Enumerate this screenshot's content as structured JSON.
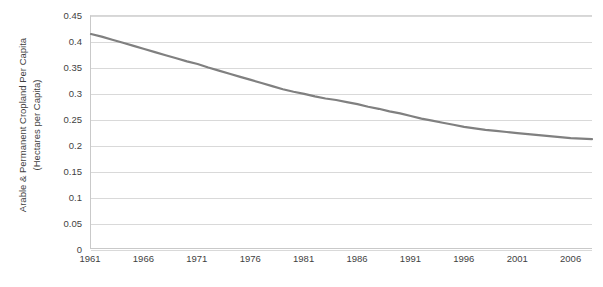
{
  "chart_data": {
    "type": "line",
    "title": "",
    "xlabel": "",
    "ylabel": "Arable & Permanent Cropland Per Capita (Hectares per Capita)",
    "ylabel_line1": "Arable & Permanent Cropland Per Capita",
    "ylabel_line2": "(Hectares per Capita)",
    "grid": true,
    "legend": "none",
    "series_color": "#808080",
    "grid_color": "#d9d9d9",
    "axis_color": "#c9c9c9",
    "xlim": [
      1961,
      2008
    ],
    "ylim": [
      0,
      0.45
    ],
    "ytick_labels": [
      "0.45",
      "0.4",
      "0.35",
      "0.3",
      "0.25",
      "0.2",
      "0.15",
      "0.1",
      "0.05",
      "0"
    ],
    "ytick_values": [
      0.45,
      0.4,
      0.35,
      0.3,
      0.25,
      0.2,
      0.15,
      0.1,
      0.05,
      0
    ],
    "xtick_labels": [
      "1961",
      "1966",
      "1971",
      "1976",
      "1981",
      "1986",
      "1991",
      "1996",
      "2001",
      "2006"
    ],
    "xtick_values": [
      1961,
      1966,
      1971,
      1976,
      1981,
      1986,
      1991,
      1996,
      2001,
      2006
    ],
    "series": [
      {
        "name": "Arable & Permanent Cropland Per Capita",
        "x": [
          1961,
          1962,
          1963,
          1964,
          1965,
          1966,
          1967,
          1968,
          1969,
          1970,
          1971,
          1972,
          1973,
          1974,
          1975,
          1976,
          1977,
          1978,
          1979,
          1980,
          1981,
          1982,
          1983,
          1984,
          1985,
          1986,
          1987,
          1988,
          1989,
          1990,
          1991,
          1992,
          1993,
          1994,
          1995,
          1996,
          1997,
          1998,
          1999,
          2000,
          2001,
          2002,
          2003,
          2004,
          2005,
          2006,
          2007,
          2008
        ],
        "values": [
          0.415,
          0.41,
          0.404,
          0.398,
          0.392,
          0.386,
          0.38,
          0.374,
          0.368,
          0.362,
          0.357,
          0.35,
          0.344,
          0.338,
          0.332,
          0.326,
          0.32,
          0.314,
          0.308,
          0.303,
          0.299,
          0.294,
          0.29,
          0.287,
          0.283,
          0.279,
          0.274,
          0.27,
          0.265,
          0.261,
          0.256,
          0.251,
          0.247,
          0.243,
          0.239,
          0.235,
          0.232,
          0.229,
          0.227,
          0.225,
          0.223,
          0.221,
          0.219,
          0.217,
          0.215,
          0.213,
          0.212,
          0.211
        ]
      }
    ]
  }
}
